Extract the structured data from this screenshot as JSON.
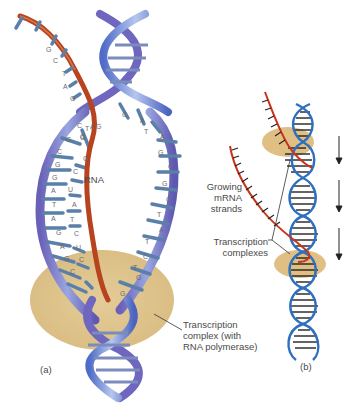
{
  "figure": {
    "panel_a": {
      "label": "(a)",
      "rna_label": "RNA",
      "complex_label_lines": [
        "Transcription",
        "complex (with",
        "RNA polymerase)"
      ],
      "rna_bases": [
        "G",
        "C",
        "T",
        "A",
        "G"
      ],
      "template_left_bases": [
        "C",
        "G",
        "C",
        "G",
        "A",
        "T",
        "A",
        "G",
        "A",
        "G",
        "C"
      ],
      "template_inner_bases": [
        "G",
        "C",
        "G",
        "C",
        "U",
        "A",
        "T",
        "C",
        "U",
        "C",
        "C"
      ],
      "coding_right_bases": [
        "G",
        "A",
        "T",
        "A",
        "G",
        "C",
        "G",
        "C",
        "T",
        "A",
        "T",
        "C",
        "T",
        "G",
        "G"
      ]
    },
    "panel_b": {
      "label": "(b)",
      "mrna_label_lines": [
        "Growing",
        "mRNA",
        "strands"
      ],
      "complex_label_lines": [
        "Transcription",
        "complexes"
      ],
      "arrow_count": 3
    },
    "colors": {
      "dna_strand": "#7b74c4",
      "dna_strand_light": "#a6b6e6",
      "rna_strand": "#b8431f",
      "complex": "#dcc08a",
      "b_dna": "#2f6fc0",
      "b_rna": "#c9351c",
      "b_complex": "#d9a75a"
    }
  }
}
